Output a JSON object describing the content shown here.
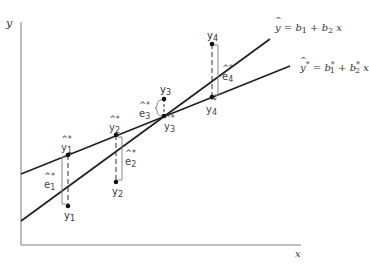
{
  "figure": {
    "type": "regression-lines-diagram",
    "axes": {
      "y_label": "y",
      "x_label": "x"
    },
    "lines": [
      {
        "id": "ols",
        "label_hat": "^",
        "label_lhs": "y",
        "label_eq": " = ",
        "b1": "b",
        "b1_sub": "1",
        "plus": " + ",
        "b2": "b",
        "b2_sub": "2",
        "x": " x",
        "color": "#222222"
      },
      {
        "id": "alt",
        "label_hat": "^",
        "label_star": "*",
        "label_lhs": "y",
        "label_eq": "= ",
        "b1": "b",
        "b1_sub": "1",
        "b1_sup": "*",
        "plus": " + ",
        "b2": "b",
        "b2_sub": "2",
        "b2_sup": "*",
        "x": " x",
        "color": "#222222"
      }
    ],
    "points": [
      {
        "obs_label": "y",
        "obs_sub": "1",
        "fit_label": "y",
        "fit_sub": "1",
        "fit_mark": "^*",
        "resid_label": "e",
        "resid_sub": "1",
        "resid_mark": "^*"
      },
      {
        "obs_label": "y",
        "obs_sub": "2",
        "fit_label": "y",
        "fit_sub": "2",
        "fit_mark": "^*",
        "resid_label": "e",
        "resid_sub": "2",
        "resid_mark": "^*"
      },
      {
        "obs_label": "y",
        "obs_sub": "3",
        "fit_label": "y",
        "fit_sub": "3",
        "fit_mark": "^*",
        "resid_label": "e",
        "resid_sub": "3",
        "resid_mark": "^*"
      },
      {
        "obs_label": "y",
        "obs_sub": "4",
        "fit_label": "y",
        "fit_sub": "4",
        "fit_mark": "^*",
        "resid_label": "e",
        "resid_sub": "4",
        "resid_mark": "^*"
      }
    ],
    "colors": {
      "axis": "#999999",
      "line": "#222222",
      "point": "#111111",
      "bracket": "#888888",
      "text": "#333333"
    }
  }
}
